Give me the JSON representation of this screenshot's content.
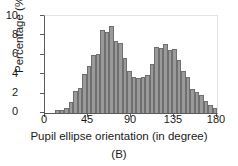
{
  "chart_data": {
    "type": "bar",
    "title": "",
    "subtitle": "",
    "caption": "(B)",
    "xlabel": "Pupil ellipse orientation (in degree)",
    "ylabel": "Percentage (%)",
    "xlim": [
      0,
      180
    ],
    "ylim": [
      0,
      10
    ],
    "grid": false,
    "legend": null,
    "bin_width": 4.5,
    "xticks": [
      0,
      45,
      90,
      135,
      180
    ],
    "xtick_labels": [
      "0",
      "45",
      "90",
      "135",
      "180"
    ],
    "yticks": [
      0,
      2,
      4,
      6,
      8,
      10
    ],
    "ytick_labels": [
      "0",
      "2",
      "4",
      "6",
      "8",
      "10"
    ],
    "bar_color": "#9a9a9a",
    "bar_edge_color": "#6f6f6f",
    "axis_color": "#5a5a5a",
    "categories": [
      "0.0",
      "4.5",
      "9.0",
      "13.5",
      "18.0",
      "22.5",
      "27.0",
      "31.5",
      "36.0",
      "40.5",
      "45.0",
      "49.5",
      "54.0",
      "58.5",
      "63.0",
      "67.5",
      "72.0",
      "76.5",
      "81.0",
      "85.5",
      "90.0",
      "94.5",
      "99.0",
      "103.5",
      "108.0",
      "112.5",
      "117.0",
      "121.5",
      "126.0",
      "130.5",
      "135.0",
      "139.5",
      "144.0",
      "148.5",
      "153.0",
      "157.5",
      "162.0",
      "166.5",
      "171.0",
      "175.5"
    ],
    "values": [
      0.0,
      0.0,
      0.0,
      0.05,
      0.3,
      0.35,
      0.5,
      1.1,
      2.3,
      2.6,
      4.0,
      4.8,
      6.0,
      6.1,
      8.6,
      8.4,
      9.0,
      7.4,
      7.2,
      5.7,
      4.3,
      3.7,
      3.6,
      3.7,
      3.9,
      5.1,
      6.8,
      6.7,
      7.1,
      6.5,
      6.6,
      5.5,
      4.3,
      3.7,
      2.5,
      2.2,
      1.9,
      1.2,
      0.8,
      0.5
    ],
    "tail_values": [
      0.35,
      0.15,
      0.05,
      0.02
    ],
    "peaks": [
      {
        "x": 72.0,
        "y": 9.0,
        "label": "first mode"
      },
      {
        "x": 126.0,
        "y": 7.1,
        "label": "second mode"
      }
    ],
    "valley": {
      "x": 99.0,
      "y": 3.6
    }
  }
}
